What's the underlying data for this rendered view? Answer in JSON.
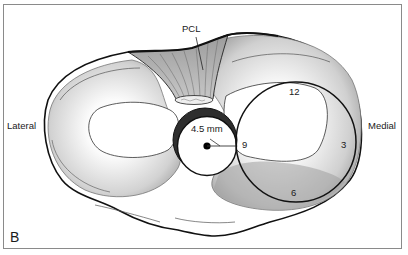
{
  "figure": {
    "panel_label": "B",
    "structure_label": "PCL",
    "orientation": {
      "left": "Lateral",
      "right": "Medial"
    },
    "measurement": {
      "label": "4.5 mm"
    },
    "clock_positions": {
      "top": "12",
      "right": "3",
      "bottom": "6",
      "left": "9"
    },
    "colors": {
      "outline": "#111111",
      "plateau_shade": "#bdbdbd",
      "plateau_light": "#f2f2f2",
      "crescent": "#2e2e2e",
      "frame": "#8a8a8a"
    }
  }
}
